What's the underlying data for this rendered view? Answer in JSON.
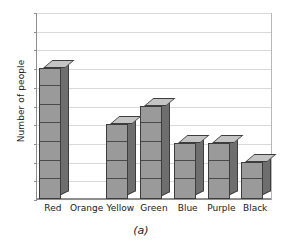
{
  "chart_data": {
    "type": "bar",
    "title": "",
    "subtitle": "",
    "caption": "(a)",
    "xlabel": "",
    "ylabel": "Number of people",
    "categories": [
      "Red",
      "Orange",
      "Yellow",
      "Green",
      "Blue",
      "Purple",
      "Black"
    ],
    "values": [
      7,
      0,
      4,
      5,
      3,
      3,
      2
    ],
    "ylim": [
      0,
      10
    ],
    "ytick_labels": [
      "0",
      "1",
      "2",
      "3",
      "4",
      "5",
      "6",
      "7",
      "8",
      "9",
      "10"
    ],
    "ytick_values": [
      0,
      1,
      2,
      3,
      4,
      5,
      6,
      7,
      8,
      9,
      10
    ],
    "grid": true,
    "grid_axis": "y",
    "legend": false,
    "style": "3d-stacked-cubes",
    "bar_front_color": "#9a9a9a",
    "bar_side_color": "#6e6e6e",
    "bar_top_color": "#c4c4c4",
    "bar_edge_color": "#3d3d3d",
    "gridline_color": "#d9d9d9",
    "axis_color": "#8e8e8e",
    "background_color": "#ffffff"
  }
}
